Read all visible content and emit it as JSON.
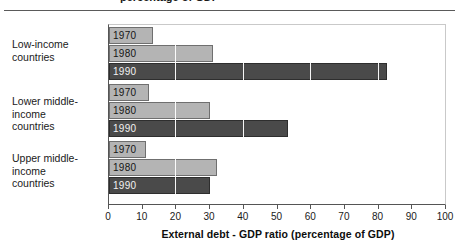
{
  "figure": {
    "clipped_title": "percentage of GDP",
    "axis_title": "External debt - GDP ratio (percentage of GDP)"
  },
  "colors": {
    "bar_light": "#b4b4b4",
    "bar_dark": "#4a4a4a",
    "axis": "#555555",
    "gridline": "#ffffff",
    "text": "#1a1a1a"
  },
  "chart_data": {
    "type": "bar",
    "orientation": "horizontal",
    "title": "",
    "xlabel": "External debt - GDP ratio (percentage of GDP)",
    "ylabel": "",
    "xlim": [
      0,
      100
    ],
    "xticks": [
      0,
      10,
      20,
      30,
      40,
      50,
      60,
      70,
      80,
      90,
      100
    ],
    "xtick_labels": [
      "0",
      "10",
      "20",
      "30",
      "40",
      "50",
      "60",
      "70",
      "80",
      "90",
      "100"
    ],
    "gridlines_at": [
      20,
      40,
      60,
      80
    ],
    "grid": true,
    "legend": "none",
    "categories": [
      "Low-income countries",
      "Lower middle-income countries",
      "Upper middle-income countries"
    ],
    "series": [
      {
        "name": "1970",
        "values": [
          13,
          12,
          11
        ]
      },
      {
        "name": "1980",
        "values": [
          31,
          30,
          32
        ]
      },
      {
        "name": "1990",
        "values": [
          82.5,
          53,
          30
        ]
      }
    ],
    "groups": [
      {
        "category_line1": "Low-income",
        "category_line2": "countries",
        "bars": [
          {
            "year": "1970",
            "value": 13,
            "style": "light"
          },
          {
            "year": "1980",
            "value": 31,
            "style": "light"
          },
          {
            "year": "1990",
            "value": 82.5,
            "style": "dark"
          }
        ]
      },
      {
        "category_line1": "Lower middle-income",
        "category_line2": "countries",
        "bars": [
          {
            "year": "1970",
            "value": 12,
            "style": "light"
          },
          {
            "year": "1980",
            "value": 30,
            "style": "light"
          },
          {
            "year": "1990",
            "value": 53,
            "style": "dark"
          }
        ]
      },
      {
        "category_line1": "Upper middle-income",
        "category_line2": "countries",
        "bars": [
          {
            "year": "1970",
            "value": 11,
            "style": "light"
          },
          {
            "year": "1980",
            "value": 32,
            "style": "light"
          },
          {
            "year": "1990",
            "value": 30,
            "style": "dark"
          }
        ]
      }
    ]
  }
}
